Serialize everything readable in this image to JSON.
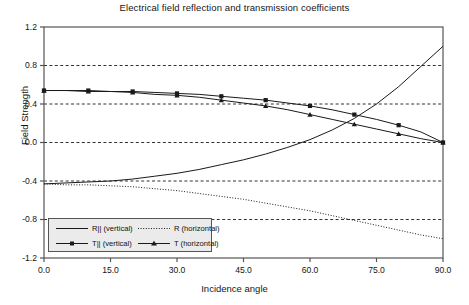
{
  "chart_data": {
    "type": "line",
    "title": "Electrical field reflection and transmission coefficients",
    "xlabel": "Incidence angle",
    "ylabel": "Field Strength",
    "xlim": [
      0,
      90
    ],
    "ylim": [
      -1.2,
      1.2
    ],
    "xticks": [
      "0.0",
      "15.0",
      "30.0",
      "45.0",
      "60.0",
      "75.0",
      "90.0"
    ],
    "xtick_values": [
      0,
      15,
      30,
      45,
      60,
      75,
      90
    ],
    "yticks": [
      "1.2",
      "0.8",
      "0.4",
      "0.0",
      "-0.4",
      "-0.8",
      "-1.2"
    ],
    "ytick_values": [
      1.2,
      0.8,
      0.4,
      0.0,
      -0.4,
      -0.8,
      -1.2
    ],
    "grid": "horizontal dashed gridlines at 0.8, 0.4, 0.0, -0.4, -0.8",
    "legend_position": "bottom-left inside plot",
    "x": [
      0,
      5,
      10,
      15,
      20,
      25,
      30,
      35,
      40,
      45,
      50,
      55,
      60,
      65,
      70,
      75,
      80,
      85,
      90
    ],
    "series": [
      {
        "name": "R|| (vertical)",
        "style": "solid",
        "marker": "none",
        "values": [
          -0.43,
          -0.42,
          -0.41,
          -0.4,
          -0.38,
          -0.35,
          -0.32,
          -0.28,
          -0.23,
          -0.18,
          -0.12,
          -0.05,
          0.03,
          0.13,
          0.25,
          0.4,
          0.58,
          0.79,
          1.0
        ]
      },
      {
        "name": "R  (horizontal)",
        "style": "dotted",
        "marker": "none",
        "values": [
          -0.43,
          -0.44,
          -0.44,
          -0.45,
          -0.46,
          -0.48,
          -0.5,
          -0.53,
          -0.56,
          -0.59,
          -0.63,
          -0.67,
          -0.71,
          -0.76,
          -0.81,
          -0.86,
          -0.91,
          -0.96,
          -1.0
        ]
      },
      {
        "name": "T|| (vertical)",
        "style": "solid",
        "marker": "square",
        "values": [
          0.54,
          0.54,
          0.54,
          0.53,
          0.53,
          0.52,
          0.51,
          0.5,
          0.48,
          0.46,
          0.44,
          0.41,
          0.38,
          0.34,
          0.29,
          0.24,
          0.18,
          0.11,
          0.0
        ]
      },
      {
        "name": "T  (horizontal)",
        "style": "solid",
        "marker": "triangle",
        "values": [
          0.54,
          0.54,
          0.53,
          0.53,
          0.52,
          0.5,
          0.49,
          0.47,
          0.44,
          0.41,
          0.38,
          0.34,
          0.29,
          0.24,
          0.19,
          0.14,
          0.09,
          0.04,
          0.0
        ]
      }
    ]
  },
  "legend": {
    "entries": [
      {
        "label": "R|| (vertical)"
      },
      {
        "label": "R   (horizontal)"
      },
      {
        "label": "T|| (vertical)"
      },
      {
        "label": "T   (horizontal)"
      }
    ]
  },
  "colors": {
    "line": "#1a1a1a",
    "grid": "#333333",
    "frame": "#555555",
    "legend_background": "#ebebeb",
    "background": "#ffffff"
  }
}
